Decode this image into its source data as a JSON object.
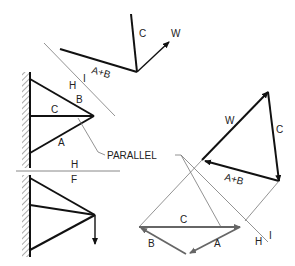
{
  "diagram": {
    "labels": {
      "c_top": "C",
      "w_top": "W",
      "ab_top": "A+B",
      "h_upper": "H",
      "i_upper": "I",
      "b_truss": "B",
      "c_truss": "C",
      "a_truss": "A",
      "parallel": "PARALLEL",
      "h_divider": "H",
      "f_divider": "F",
      "w_triangle": "W",
      "c_triangle": "C",
      "ab_triangle": "A+B",
      "c_lower": "C",
      "b_lower": "B",
      "a_lower": "A",
      "h_lower": "H",
      "i_lower": "I"
    },
    "colors": {
      "line": "#111111",
      "construction": "#777777",
      "grey_vector": "#666666"
    }
  }
}
